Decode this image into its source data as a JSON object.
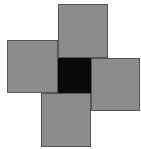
{
  "diagram": {
    "colors": {
      "square_fill": "#c8c8c8",
      "stipple": "#8a8a8a",
      "border": "#555555",
      "center": "#0a0a0a",
      "background": "#ffffff"
    },
    "squares": [
      {
        "name": "top",
        "x": 58,
        "y": 4,
        "w": 50,
        "h": 54
      },
      {
        "name": "left",
        "x": 7,
        "y": 40,
        "w": 51,
        "h": 53
      },
      {
        "name": "right",
        "x": 91,
        "y": 58,
        "w": 49,
        "h": 53
      },
      {
        "name": "bottom",
        "x": 41,
        "y": 93,
        "w": 50,
        "h": 54
      }
    ],
    "center": {
      "x": 58,
      "y": 58,
      "w": 33,
      "h": 35
    }
  }
}
